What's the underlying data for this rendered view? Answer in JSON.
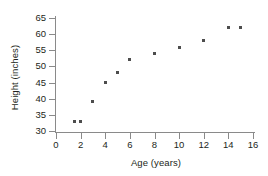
{
  "chart_data": {
    "type": "scatter",
    "title": "",
    "xlabel": "Age (years)",
    "ylabel": "Height (inches)",
    "xlim": [
      0,
      16
    ],
    "ylim": [
      30,
      65
    ],
    "xticks": [
      0,
      2,
      4,
      6,
      8,
      10,
      12,
      14,
      16
    ],
    "yticks": [
      30,
      35,
      40,
      45,
      50,
      55,
      60,
      65
    ],
    "grid": false,
    "legend": null,
    "marker_color": "#4d4d4d",
    "axis_color": "#8a8a8a",
    "x": [
      1.5,
      2,
      3,
      4,
      5,
      6,
      8,
      10,
      12,
      14,
      15
    ],
    "y": [
      33,
      33,
      39,
      45,
      48,
      52,
      54,
      56,
      58,
      62,
      62
    ],
    "points": [
      {
        "x": 1.5,
        "y": 33
      },
      {
        "x": 2,
        "y": 33
      },
      {
        "x": 3,
        "y": 39
      },
      {
        "x": 4,
        "y": 45
      },
      {
        "x": 5,
        "y": 48
      },
      {
        "x": 6,
        "y": 52
      },
      {
        "x": 8,
        "y": 54
      },
      {
        "x": 10,
        "y": 56
      },
      {
        "x": 12,
        "y": 58
      },
      {
        "x": 14,
        "y": 62
      },
      {
        "x": 15,
        "y": 62
      }
    ]
  },
  "axes": {
    "x_title": "Age (years)",
    "y_title": "Height (inches)",
    "x_tick_labels": [
      "0",
      "2",
      "4",
      "6",
      "8",
      "10",
      "12",
      "14",
      "16"
    ],
    "y_tick_labels": [
      "65",
      "60",
      "55",
      "50",
      "45",
      "40",
      "35",
      "30"
    ]
  }
}
